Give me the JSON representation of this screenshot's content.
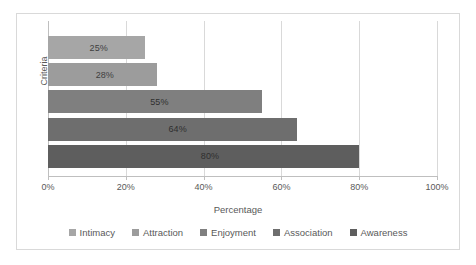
{
  "chart_data": {
    "type": "bar",
    "orientation": "horizontal",
    "title": "",
    "xlabel": "Percentage",
    "ylabel": "Criteria",
    "xlim": [
      0,
      100
    ],
    "xticks": [
      0,
      20,
      40,
      60,
      80,
      100
    ],
    "xtick_labels": [
      "0%",
      "20%",
      "40%",
      "60%",
      "80%",
      "100%"
    ],
    "grid": true,
    "grid_axis": "x",
    "legend_position": "bottom",
    "categories": [
      "Intimacy",
      "Attraction",
      "Enjoyment",
      "Association",
      "Awareness"
    ],
    "values": [
      25,
      28,
      55,
      64,
      80
    ],
    "data_labels": [
      "25%",
      "28%",
      "55%",
      "64%",
      "80%"
    ],
    "colors": [
      "#a6a6a6",
      "#9c9c9c",
      "#7f7f7f",
      "#6e6e6e",
      "#5e5e5e"
    ],
    "series": [
      {
        "name": "Intimacy",
        "value": 25,
        "label": "25%",
        "color": "#a6a6a6"
      },
      {
        "name": "Attraction",
        "value": 28,
        "label": "28%",
        "color": "#9c9c9c"
      },
      {
        "name": "Enjoyment",
        "value": 55,
        "label": "55%",
        "color": "#7f7f7f"
      },
      {
        "name": "Association",
        "value": 64,
        "label": "64%",
        "color": "#6e6e6e"
      },
      {
        "name": "Awareness",
        "value": 80,
        "label": "80%",
        "color": "#5e5e5e"
      }
    ]
  },
  "axes": {
    "y_title": "Criteria",
    "x_title": "Percentage"
  },
  "legend": {
    "items": [
      {
        "label": "Intimacy",
        "color": "#a6a6a6"
      },
      {
        "label": "Attraction",
        "color": "#9c9c9c"
      },
      {
        "label": "Enjoyment",
        "color": "#7f7f7f"
      },
      {
        "label": "Association",
        "color": "#6e6e6e"
      },
      {
        "label": "Awareness",
        "color": "#5e5e5e"
      }
    ]
  },
  "style": {
    "border_color": "#d9d9d9",
    "gridline_color": "#d9d9d9",
    "axis_color": "#bfbfbf",
    "text_color": "#595959",
    "plot_background": "#ffffff"
  }
}
